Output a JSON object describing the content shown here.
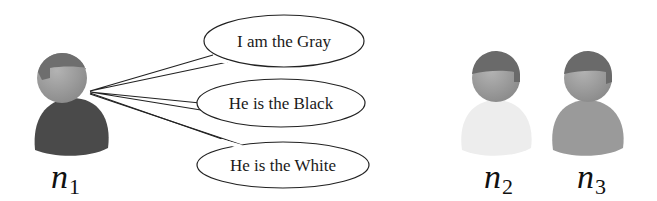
{
  "diagram": {
    "speaker": {
      "id": "n1",
      "label_main": "n",
      "label_sub": "1",
      "head_color": "#9a9a9a",
      "hair_color": "#6e6e6e",
      "body_color": "#4a4a4a"
    },
    "statements": [
      {
        "text": "I am the Gray"
      },
      {
        "text": "He is the Black"
      },
      {
        "text": "He is the White"
      }
    ],
    "others": [
      {
        "id": "n2",
        "label_main": "n",
        "label_sub": "2",
        "body_color": "#efefef"
      },
      {
        "id": "n3",
        "label_main": "n",
        "label_sub": "3",
        "body_color": "#9c9c9c"
      }
    ]
  }
}
